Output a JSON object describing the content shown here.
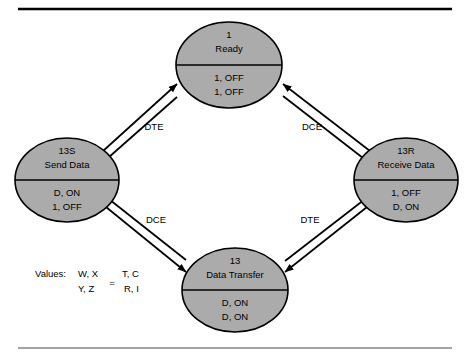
{
  "figure": {
    "type": "state-transition-diagram",
    "top_rule": true,
    "bottom_rule": true
  },
  "nodes": [
    {
      "id": "ready",
      "number": "1",
      "name": "Ready",
      "value_line1": "1, OFF",
      "value_line2": "1, OFF",
      "position": "top"
    },
    {
      "id": "send-data",
      "number": "13S",
      "name": "Send Data",
      "value_line1": "D, ON",
      "value_line2": "1, OFF",
      "position": "left"
    },
    {
      "id": "receive-data",
      "number": "13R",
      "name": "Receive Data",
      "value_line1": "1, OFF",
      "value_line2": "D, ON",
      "position": "right"
    },
    {
      "id": "data-transfer",
      "number": "13",
      "name": "Data Transfer",
      "value_line1": "D, ON",
      "value_line2": "D, ON",
      "position": "bottom"
    }
  ],
  "edges": [
    {
      "id": "ready-send",
      "label": "DTE",
      "from": "ready",
      "to": "send-data",
      "bidirectional": true
    },
    {
      "id": "ready-receive",
      "label": "DCE",
      "from": "ready",
      "to": "receive-data",
      "bidirectional": true
    },
    {
      "id": "send-transfer",
      "label": "DCE",
      "from": "send-data",
      "to": "data-transfer",
      "bidirectional": true
    },
    {
      "id": "receive-transfer",
      "label": "DTE",
      "from": "receive-data",
      "to": "data-transfer",
      "bidirectional": true
    }
  ],
  "legend": {
    "prefix": "Values:",
    "left_numerator": "W, X",
    "left_denominator": "Y, Z",
    "equals": "=",
    "right_numerator": "T, C",
    "right_denominator": "R, I"
  },
  "colors": {
    "node_fill": "#ababab",
    "stroke": "#000000",
    "background": "#ffffff"
  }
}
